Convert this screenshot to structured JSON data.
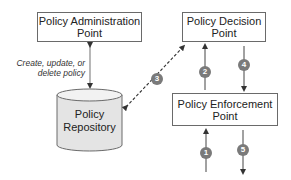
{
  "diagram": {
    "nodes": {
      "pap": {
        "line1": "Policy Administration",
        "line2": "Point"
      },
      "pdp": {
        "line1": "Policy Decision",
        "line2": "Point"
      },
      "pep": {
        "line1": "Policy Enforcement",
        "line2": "Point"
      },
      "repository": {
        "line1": "Policy",
        "line2": "Repository"
      }
    },
    "edge_label": {
      "line1": "Create, update, or",
      "line2": "delete policy"
    },
    "steps": [
      "1",
      "2",
      "3",
      "4",
      "5"
    ],
    "colors": {
      "border": "#6a6a6a",
      "badge": "#7a7a7a",
      "cylinder_fill": "#e4e4e4"
    }
  }
}
